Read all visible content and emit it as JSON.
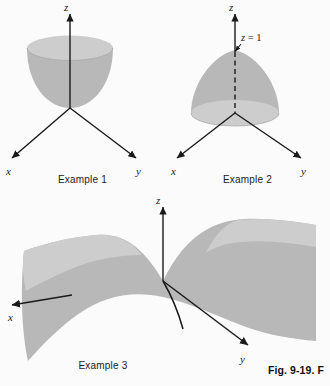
{
  "figure": {
    "caption": "Fig. 9-19. F",
    "background_color": "#fbfbfb",
    "surface_fill": "#b8b8b8",
    "surface_highlight": "#cfcfcf",
    "line_color": "#1a1a1a"
  },
  "panels": [
    {
      "id": "example1",
      "caption": "Example 1",
      "surface_type": "elliptic-paraboloid-opening-upward",
      "axes": {
        "z": "z",
        "x": "x",
        "y": "y"
      }
    },
    {
      "id": "example2",
      "caption": "Example 2",
      "surface_type": "cone-opening-downward-apex-at-top",
      "annotation": "z = 1",
      "annotation_parts": {
        "variable": "z",
        "relation": " = 1"
      },
      "axes": {
        "z": "z",
        "x": "x",
        "y": "y"
      }
    },
    {
      "id": "example3",
      "caption": "Example 3",
      "surface_type": "hyperbolic-paraboloid-saddle",
      "axes": {
        "z": "z",
        "x": "x",
        "y": "y"
      }
    }
  ]
}
